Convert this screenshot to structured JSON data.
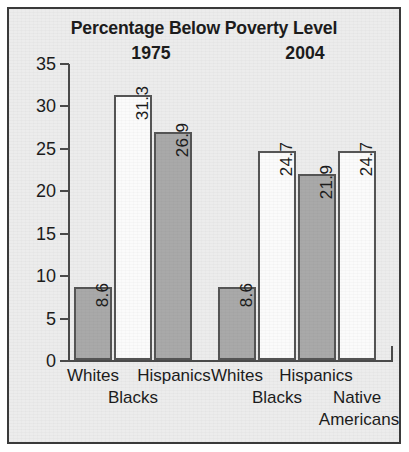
{
  "chart_data": {
    "type": "bar",
    "title": "Percentage Below Poverty Level",
    "xlabel": "",
    "ylabel": "",
    "ylim": [
      0,
      35
    ],
    "yticks": [
      0,
      5,
      10,
      15,
      20,
      25,
      30,
      35
    ],
    "grid": false,
    "legend": "none",
    "groups": [
      {
        "year": "1975",
        "categories": [
          "Whites",
          "Blacks",
          "Hispanics"
        ],
        "values": [
          8.6,
          31.3,
          26.9
        ],
        "fills": [
          "gray",
          "white",
          "gray"
        ]
      },
      {
        "year": "2004",
        "categories": [
          "Whites",
          "Blacks",
          "Hispanics",
          "Native Americans"
        ],
        "values": [
          8.6,
          24.7,
          21.9,
          24.7
        ],
        "fills": [
          "gray",
          "white",
          "gray",
          "white"
        ]
      }
    ],
    "colors": {
      "gray_bar": "#a9a9a9",
      "white_bar": "#fbfbfb",
      "bar_outline": "#555555",
      "background": "#ececec",
      "frame": "#3a3a3a",
      "text": "#1c1c1c"
    }
  },
  "axis": {
    "tick_labels": [
      "0",
      "5",
      "10",
      "15",
      "20",
      "25",
      "30",
      "35"
    ]
  },
  "bars": [
    {
      "value": "8.6",
      "fill": "gray",
      "left": 65,
      "width": 38,
      "height": 73
    },
    {
      "value": "31.3",
      "fill": "white",
      "left": 105,
      "width": 38,
      "height": 265
    },
    {
      "value": "26.9",
      "fill": "gray",
      "left": 145,
      "width": 38,
      "height": 228
    },
    {
      "value": "8.6",
      "fill": "gray",
      "left": 209,
      "width": 38,
      "height": 73
    },
    {
      "value": "24.7",
      "fill": "white",
      "left": 249,
      "width": 38,
      "height": 209
    },
    {
      "value": "21.9",
      "fill": "gray",
      "left": 289,
      "width": 38,
      "height": 186
    },
    {
      "value": "24.7",
      "fill": "white",
      "left": 329,
      "width": 38,
      "height": 209
    }
  ],
  "category_labels": [
    {
      "text": "Whites",
      "left": 48,
      "width": 72,
      "top": 357
    },
    {
      "text": "Blacks",
      "left": 88,
      "width": 72,
      "top": 379
    },
    {
      "text": "Hispanics",
      "left": 119,
      "width": 92,
      "top": 357
    },
    {
      "text": "Whites",
      "left": 192,
      "width": 72,
      "top": 357
    },
    {
      "text": "Blacks",
      "left": 232,
      "width": 72,
      "top": 379
    },
    {
      "text": "Hispanics",
      "left": 261,
      "width": 92,
      "top": 357
    },
    {
      "text": "Native",
      "left": 312,
      "width": 72,
      "top": 379
    },
    {
      "text": "Americans",
      "left": 304,
      "width": 92,
      "top": 401
    }
  ]
}
